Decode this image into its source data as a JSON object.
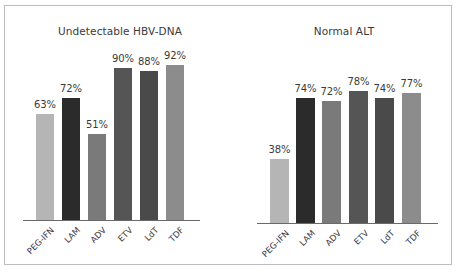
{
  "chart_data": [
    {
      "type": "bar",
      "title": "Undetectable HBV-DNA",
      "categories": [
        "PEG-IFN",
        "LAM",
        "ADV",
        "ETV",
        "LdT",
        "TDF"
      ],
      "values": [
        63,
        72,
        51,
        90,
        88,
        92
      ],
      "value_labels": [
        "63%",
        "72%",
        "51%",
        "90%",
        "88%",
        "92%"
      ],
      "colors": [
        "#b5b5b5",
        "#2b2b2b",
        "#7a7a7a",
        "#555555",
        "#4a4a4a",
        "#8c8c8c"
      ],
      "xlabel": "",
      "ylabel": "",
      "ylim": [
        0,
        100
      ],
      "grid": false,
      "legend": "none",
      "layout": {
        "title_x": 120,
        "title_y": 25,
        "baseline_y": 220,
        "baseline_x0": 23,
        "baseline_x1": 200,
        "bar_lefts": [
          36,
          62,
          88,
          114,
          140,
          166
        ],
        "bar_width": 18,
        "px_per_unit": 1.69
      }
    },
    {
      "type": "bar",
      "title": "Normal ALT",
      "categories": [
        "PEG-IFN",
        "LAM",
        "ADV",
        "ETV",
        "LdT",
        "TDF"
      ],
      "values": [
        38,
        74,
        72,
        78,
        74,
        77
      ],
      "value_labels": [
        "38%",
        "74%",
        "72%",
        "78%",
        "74%",
        "77%"
      ],
      "colors": [
        "#b5b5b5",
        "#2b2b2b",
        "#7a7a7a",
        "#555555",
        "#4a4a4a",
        "#8c8c8c"
      ],
      "xlabel": "",
      "ylabel": "",
      "ylim": [
        0,
        100
      ],
      "grid": false,
      "legend": "none",
      "layout": {
        "title_x": 344,
        "title_y": 25,
        "baseline_y": 223,
        "baseline_x0": 257,
        "baseline_x1": 438,
        "bar_lefts": [
          270,
          296,
          322,
          349,
          375,
          402
        ],
        "bar_width": 19,
        "px_per_unit": 1.69
      }
    }
  ]
}
